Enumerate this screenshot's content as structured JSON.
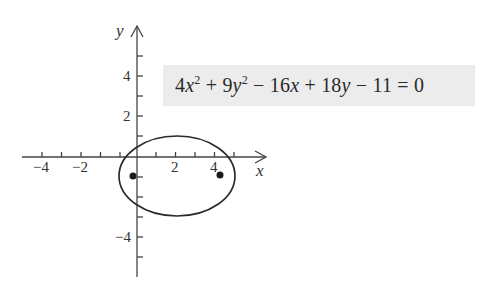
{
  "equation": {
    "text": "4x^2 + 9y^2 - 16x + 18y - 11 = 0",
    "parts": {
      "c1": "4",
      "v1": "x",
      "e1": "2",
      "op1": " + ",
      "c2": "9",
      "v2": "y",
      "e2": "2",
      "op2": " − ",
      "c3": "16",
      "v3": "x",
      "op3": " + ",
      "c4": "18",
      "v4": "y",
      "op4": " − ",
      "c5": "11",
      "op5": " = ",
      "rhs": "0"
    },
    "box_color": "#ececec"
  },
  "axes": {
    "x_label": "x",
    "y_label": "y",
    "x_tick_labels": [
      "−4",
      "−2",
      "2",
      "4"
    ],
    "y_tick_labels": [
      "4",
      "2",
      "−4"
    ]
  },
  "ellipse": {
    "center": [
      2,
      -1
    ],
    "semi_major_x": 3,
    "semi_minor_y": 2,
    "foci": [
      [
        -0.24,
        -1
      ],
      [
        4.24,
        -1
      ]
    ]
  },
  "colors": {
    "stroke": "#333333",
    "label": "#333333"
  }
}
